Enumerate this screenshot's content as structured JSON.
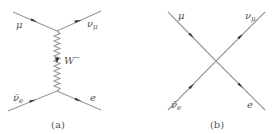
{
  "colors": {
    "line": "#9a9a9a",
    "arrow": "#333333",
    "text": "#555555",
    "background": "#ffffff"
  },
  "diagram_a": {
    "caption": "(a)",
    "boson": {
      "label_main": "W",
      "label_sup": "−"
    },
    "particles": {
      "top_left": {
        "main": "μ",
        "sub": ""
      },
      "top_right": {
        "main": "ν",
        "sub": "μ"
      },
      "bottom_left": {
        "main": "ν̄",
        "sub": "e"
      },
      "bottom_right": {
        "main": "e",
        "sub": ""
      }
    }
  },
  "diagram_b": {
    "caption": "(b)",
    "particles": {
      "top_left": {
        "main": "μ",
        "sub": ""
      },
      "top_right": {
        "main": "ν",
        "sub": "μ"
      },
      "bottom_left": {
        "main": "ν̄",
        "sub": "e"
      },
      "bottom_right": {
        "main": "e",
        "sub": ""
      }
    }
  }
}
